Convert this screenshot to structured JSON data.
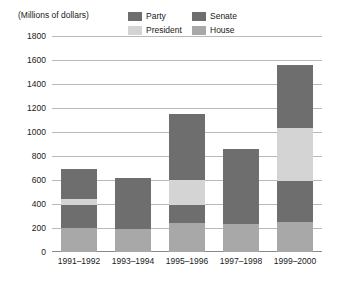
{
  "unit_caption": "(Millions of dollars)",
  "legend": {
    "items": [
      {
        "label": "Party",
        "color": "#6e6e6e",
        "icon": "legend-swatch-icon"
      },
      {
        "label": "Senate",
        "color": "#6e6e6e",
        "icon": "legend-swatch-icon"
      },
      {
        "label": "President",
        "color": "#d4d4d4",
        "icon": "legend-swatch-icon"
      },
      {
        "label": "House",
        "color": "#a8a8a8",
        "icon": "legend-swatch-icon"
      }
    ]
  },
  "chart_data": {
    "type": "bar",
    "title": "",
    "subtitle": "",
    "xlabel": "",
    "ylabel": "(Millions of dollars)",
    "ylim": [
      0,
      1800
    ],
    "ytick_step": 200,
    "yticks": [
      1800,
      1600,
      1400,
      1200,
      1000,
      800,
      600,
      400,
      200,
      0
    ],
    "ytick_labels": [
      "1800",
      "1600",
      "1400",
      "1200",
      "1000",
      "800",
      "600",
      "400",
      "200",
      "0"
    ],
    "grid": true,
    "stacked": true,
    "legend_position": "top",
    "categories": [
      "1991–1992",
      "1993–1994",
      "1995–1996",
      "1997–1998",
      "1999–2000"
    ],
    "series": [
      {
        "name": "House",
        "color": "#a8a8a8",
        "values": [
          200,
          190,
          240,
          235,
          250
        ]
      },
      {
        "name": "Senate",
        "color": "#6e6e6e",
        "values": [
          190,
          140,
          150,
          185,
          340
        ]
      },
      {
        "name": "President",
        "color": "#d4d4d4",
        "values": [
          50,
          0,
          210,
          0,
          440
        ]
      },
      {
        "name": "Party",
        "color": "#6e6e6e",
        "values": [
          250,
          290,
          550,
          440,
          530
        ]
      }
    ],
    "totals": [
      690,
      620,
      1150,
      860,
      1560
    ]
  }
}
